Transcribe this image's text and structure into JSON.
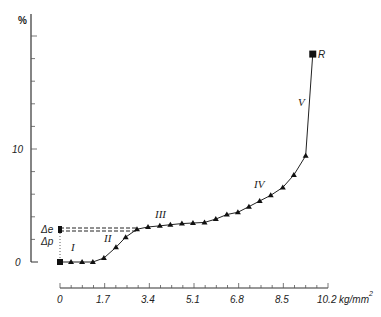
{
  "chart_data": {
    "type": "line",
    "title": "",
    "xlabel": "kg/mm²",
    "ylabel": "%",
    "xlim": [
      0,
      10.2
    ],
    "ylim": [
      0,
      22
    ],
    "x_ticks": [
      "0",
      "1.7",
      "3.4",
      "5.1",
      "6.8",
      "8.5",
      "10.2"
    ],
    "x_unit_label": "kg/mm",
    "x_unit_sup": "2",
    "y_ticks": [
      "0",
      "10"
    ],
    "y_axis_label": "%",
    "grid": false,
    "legend": null,
    "series": [
      {
        "name": "stress-strain",
        "marker": "triangle",
        "x": [
          0,
          0.42,
          0.84,
          1.25,
          1.67,
          2.13,
          2.5,
          2.93,
          3.35,
          3.8,
          4.2,
          4.64,
          5.06,
          5.5,
          5.93,
          6.35,
          6.77,
          7.19,
          7.6,
          8.02,
          8.48,
          8.9,
          9.35,
          9.62
        ],
        "y": [
          0,
          0,
          0,
          0,
          0.35,
          1.3,
          2.2,
          2.9,
          3.1,
          3.2,
          3.3,
          3.4,
          3.45,
          3.5,
          3.8,
          4.2,
          4.4,
          4.9,
          5.4,
          5.9,
          6.6,
          7.7,
          9.4,
          18.4
        ]
      }
    ],
    "annotations": [
      {
        "text": "R",
        "x": 9.62,
        "y": 18.4,
        "note": "rupture point, square marker"
      },
      {
        "text": "I",
        "region": "elastic start"
      },
      {
        "text": "II",
        "region": "rise"
      },
      {
        "text": "III",
        "region": "plateau"
      },
      {
        "text": "IV",
        "region": "hardening"
      },
      {
        "text": "V",
        "region": "final rise"
      },
      {
        "text": "Δe",
        "y": 2.9
      },
      {
        "text": "Δp",
        "y": 2.0
      }
    ],
    "dashed_reference_y": 2.9
  },
  "labels": {
    "y_unit": "%",
    "y_tick_0": "0",
    "y_tick_10": "10",
    "x_tick_0": "0",
    "x_tick_1": "1.7",
    "x_tick_2": "3.4",
    "x_tick_3": "5.1",
    "x_tick_4": "6.8",
    "x_tick_5": "8.5",
    "x_tick_6": "10.2",
    "x_unit": "kg/mm",
    "x_unit_sup": "2",
    "R": "R",
    "I": "I",
    "II": "II",
    "III": "III",
    "IV": "IV",
    "V": "V",
    "delta_e": "Δe",
    "delta_p": "Δp"
  }
}
